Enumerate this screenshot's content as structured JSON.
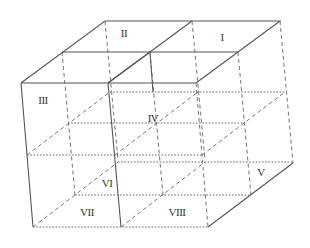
{
  "diagram": {
    "labels": [
      {
        "id": "I",
        "text": "I",
        "x": 222,
        "y": 37
      },
      {
        "id": "II",
        "text": "II",
        "x": 124,
        "y": 33
      },
      {
        "id": "III",
        "text": "III",
        "x": 43,
        "y": 100
      },
      {
        "id": "IV",
        "text": "IV",
        "x": 153,
        "y": 118
      },
      {
        "id": "V",
        "text": "V",
        "x": 261,
        "y": 172
      },
      {
        "id": "VI",
        "text": "VI",
        "x": 107,
        "y": 183
      },
      {
        "id": "VII",
        "text": "VII",
        "x": 87,
        "y": 212
      },
      {
        "id": "VIII",
        "text": "VIII",
        "x": 177,
        "y": 212
      }
    ]
  }
}
